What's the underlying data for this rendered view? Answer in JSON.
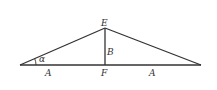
{
  "diagram": {
    "type": "isosceles-triangle-with-altitude",
    "points": {
      "left": [
        20,
        65
      ],
      "apex": [
        105,
        28
      ],
      "foot": [
        105,
        65
      ],
      "right": [
        201,
        65
      ]
    },
    "labels": {
      "apex": "E",
      "foot": "F",
      "altitude": "B",
      "angle": "α",
      "left_half": "A",
      "right_half": "A"
    },
    "stroke_color": "#333333"
  }
}
